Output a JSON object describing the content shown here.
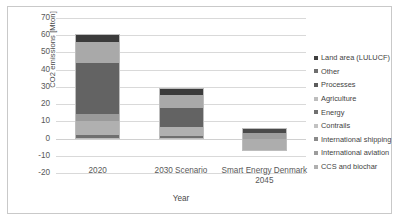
{
  "chart_data": {
    "type": "bar",
    "stacked": true,
    "title": "",
    "xlabel": "Year",
    "ylabel": "CO2 emissions [Mton]",
    "ylim": [
      -20,
      70
    ],
    "ytick_step": 10,
    "yticks": [
      "70",
      "60",
      "50",
      "40",
      "30",
      "20",
      "10",
      "0",
      "-10",
      "-20"
    ],
    "grid": true,
    "legend_position": "right",
    "categories": [
      "2020",
      "2030 Scenario",
      "Smart Energy Denmark 2045"
    ],
    "series": [
      {
        "name": "Land area (LULUCF)",
        "color": "#3f3f3f",
        "values": [
          5.0,
          4.0,
          3.5
        ]
      },
      {
        "name": "Other",
        "color": "#a6a6a6",
        "values": [
          12.0,
          5.5,
          2.5
        ]
      },
      {
        "name": "Processes",
        "color": "#6e6e6e",
        "values": [
          30.0,
          10.5,
          0.0
        ]
      },
      {
        "name": "Agriculture",
        "color": "#767676",
        "values": [
          4.0,
          2.5,
          0.0
        ]
      },
      {
        "name": "Energy",
        "color": "#b3b3b3",
        "values": [
          7.5,
          4.5,
          0.0
        ]
      },
      {
        "name": "Contrails",
        "color": "#8f8f8f",
        "values": [
          0.0,
          0.0,
          0.0
        ]
      },
      {
        "name": "International shipping",
        "color": "#9b9b9b",
        "values": [
          1.0,
          1.5,
          0.0
        ]
      },
      {
        "name": "International aviation",
        "color": "#858585",
        "values": [
          1.5,
          1.0,
          0.0
        ]
      },
      {
        "name": "CCS and biochar",
        "color": "#c4c4c4",
        "values": [
          0.0,
          0.0,
          -7.0
        ]
      }
    ],
    "totals": [
      61.0,
      29.5,
      6.0
    ]
  },
  "legend": {
    "items": [
      {
        "label": "Land area (LULUCF)",
        "color": "#3f3f3f"
      },
      {
        "label": "Other",
        "color": "#6e6e6e"
      },
      {
        "label": "Processes",
        "color": "#5c5c5c"
      },
      {
        "label": "Agriculture",
        "color": "#bdbdbd"
      },
      {
        "label": "Energy",
        "color": "#707070"
      },
      {
        "label": "Contrails",
        "color": "#c2c2c2"
      },
      {
        "label": "International shipping",
        "color": "#8a8a8a"
      },
      {
        "label": "International aviation",
        "color": "#9c9c9c"
      },
      {
        "label": "CCS and biochar",
        "color": "#b0b0b0"
      }
    ]
  },
  "bars": [
    {
      "category": "2020",
      "label_lines": [
        "2020"
      ],
      "segments": [
        {
          "name": "bottom-dark",
          "from": 0.0,
          "to": 2.0,
          "color": "#6f6f6f"
        },
        {
          "name": "light-lower",
          "from": 2.0,
          "to": 10.0,
          "color": "#b0b0b0"
        },
        {
          "name": "mid-light",
          "from": 10.0,
          "to": 14.0,
          "color": "#9a9a9a"
        },
        {
          "name": "dark-main",
          "from": 14.0,
          "to": 44.0,
          "color": "#636363"
        },
        {
          "name": "light-upper",
          "from": 44.0,
          "to": 56.0,
          "color": "#a9a9a9"
        },
        {
          "name": "top-dark",
          "from": 56.0,
          "to": 61.0,
          "color": "#3b3b3b"
        }
      ]
    },
    {
      "category": "2030 Scenario",
      "label_lines": [
        "2030 Scenario"
      ],
      "segments": [
        {
          "name": "bottom-dark",
          "from": 0.0,
          "to": 1.5,
          "color": "#6f6f6f"
        },
        {
          "name": "light-lower",
          "from": 1.5,
          "to": 6.5,
          "color": "#b0b0b0"
        },
        {
          "name": "dark-main",
          "from": 6.5,
          "to": 17.5,
          "color": "#636363"
        },
        {
          "name": "light-upper",
          "from": 17.5,
          "to": 25.5,
          "color": "#a9a9a9"
        },
        {
          "name": "top-dark",
          "from": 25.5,
          "to": 29.5,
          "color": "#3b3b3b"
        }
      ]
    },
    {
      "category": "Smart Energy Denmark 2045",
      "label_lines": [
        "Smart Energy Denmark",
        "2045"
      ],
      "segments": [
        {
          "name": "ccs-negative",
          "from": -7.0,
          "to": -0.5,
          "color": "#adadad"
        },
        {
          "name": "light-lower",
          "from": -0.5,
          "to": 3.0,
          "color": "#9e9e9e"
        },
        {
          "name": "top-dark",
          "from": 3.0,
          "to": 6.0,
          "color": "#4a4a4a"
        }
      ]
    }
  ]
}
